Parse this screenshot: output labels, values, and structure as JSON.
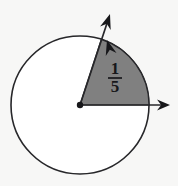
{
  "figure": {
    "background_color": "#f7f7f6",
    "stroke_color": "#27272a",
    "sector_fill_color": "#808080",
    "label_color": "#17171a",
    "circle": {
      "center_x": 80,
      "center_y": 105,
      "radius": 69,
      "stroke_width": 1.6,
      "fill": "#ffffff"
    },
    "center_point": {
      "label": "vertex",
      "radius": 3.2,
      "color": "#17171a"
    },
    "sector": {
      "fraction_label": "1/5",
      "numerator": "1",
      "denominator": "5",
      "start_angle_deg": 0,
      "end_angle_deg": 72,
      "fill_color": "#808080",
      "label_x": 115,
      "label_y": 78
    },
    "rays": [
      {
        "name": "horizontal-ray",
        "angle_deg": 0,
        "tip_x": 170,
        "tip_y": 105
      },
      {
        "name": "diagonal-ray",
        "angle_deg": 72,
        "tip_x": 110,
        "tip_y": 14
      }
    ],
    "arrowheads": [
      {
        "name": "horizontal-arrowhead",
        "x": 170,
        "y": 105,
        "angle_deg": 0
      },
      {
        "name": "diagonal-arrowhead-outer",
        "x": 110,
        "y": 14,
        "angle_deg": 72
      },
      {
        "name": "diagonal-arrowhead-inner",
        "x": 107,
        "y": 40,
        "angle_deg": 72
      }
    ]
  }
}
